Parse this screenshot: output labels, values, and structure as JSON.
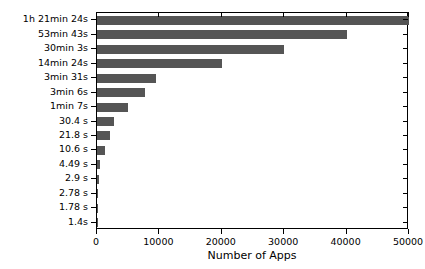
{
  "chart_data": {
    "type": "bar",
    "orientation": "horizontal",
    "title": "",
    "xlabel": "Number of Apps",
    "ylabel": "",
    "xlim": [
      0,
      50000
    ],
    "ylim": [
      0,
      15
    ],
    "grid": false,
    "legend": null,
    "bar_color": "#555555",
    "axis_color": "#000000",
    "background_color": "#ffffff",
    "xticks": [
      0,
      10000,
      20000,
      30000,
      40000,
      50000
    ],
    "xticklabels": [
      "0",
      "10000",
      "20000",
      "30000",
      "40000",
      "50000"
    ],
    "categories": [
      "1h 21min 24s",
      "53min 43s",
      "30min 3s",
      "14min 24s",
      "3min 31s",
      "3min 6s",
      "1min 7s",
      "30.4 s",
      "21.8 s",
      "10.6 s",
      "4.49 s",
      "2.9 s",
      "2.78 s",
      "1.78 s",
      "1.4s"
    ],
    "values": [
      50000,
      40000,
      30000,
      20000,
      9500,
      7700,
      5000,
      2700,
      2100,
      1300,
      500,
      250,
      200,
      120,
      60
    ]
  }
}
